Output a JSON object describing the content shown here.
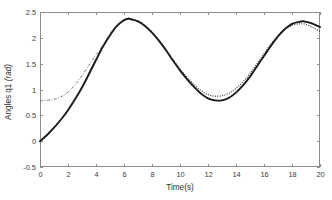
{
  "figure": {
    "background_color": "#ffffff",
    "axis_color": "#8c8c8c",
    "plot_area": {
      "left": 40,
      "top": 12,
      "right": 320,
      "bottom": 167
    }
  },
  "chart_data": {
    "type": "line",
    "title": "",
    "xlabel": "Time(s)",
    "ylabel": "Angles q1 (rad)",
    "ylabel_main": "Angles q1",
    "ylabel_unit": "(rad)",
    "xlim": [
      0,
      20
    ],
    "ylim": [
      -0.5,
      2.5
    ],
    "xticks": [
      0,
      2,
      4,
      6,
      8,
      10,
      12,
      14,
      16,
      18,
      20
    ],
    "xtick_labels": [
      "0",
      "2",
      "4",
      "6",
      "8",
      "10",
      "12",
      "14",
      "16",
      "18",
      "20"
    ],
    "yticks": [
      -0.5,
      0,
      0.5,
      1,
      1.5,
      2,
      2.5
    ],
    "ytick_labels": [
      "-0.5",
      "0",
      "0.5",
      "1",
      "1.5",
      "2",
      "2.5"
    ],
    "grid": false,
    "legend": false,
    "legend_position": "none",
    "annotations": [],
    "x": [
      0,
      0.5,
      1,
      1.5,
      2,
      2.5,
      3,
      3.5,
      4,
      4.5,
      5,
      5.5,
      6,
      6.3,
      6.5,
      7,
      7.5,
      8,
      8.5,
      9,
      9.5,
      10,
      10.5,
      11,
      11.5,
      12,
      12.5,
      13,
      13.5,
      14,
      14.5,
      15,
      15.5,
      16,
      16.5,
      17,
      17.5,
      18,
      18.5,
      18.8,
      19,
      19.5,
      20
    ],
    "series": [
      {
        "name": "reference-trajectory",
        "style": "solid",
        "color": "#1a1a1a",
        "values": [
          0.0,
          0.12,
          0.26,
          0.42,
          0.6,
          0.81,
          1.04,
          1.3,
          1.57,
          1.83,
          2.05,
          2.23,
          2.34,
          2.37,
          2.36,
          2.32,
          2.23,
          2.1,
          1.94,
          1.76,
          1.56,
          1.37,
          1.2,
          1.05,
          0.92,
          0.83,
          0.79,
          0.79,
          0.84,
          0.94,
          1.08,
          1.25,
          1.45,
          1.65,
          1.85,
          2.03,
          2.17,
          2.27,
          2.31,
          2.32,
          2.31,
          2.27,
          2.21
        ]
      },
      {
        "name": "tracked-output-dotted",
        "style": "dotted",
        "color": "#2b2b2b",
        "values": [
          0.0,
          0.12,
          0.26,
          0.42,
          0.6,
          0.81,
          1.05,
          1.32,
          1.59,
          1.85,
          2.07,
          2.25,
          2.35,
          2.38,
          2.37,
          2.33,
          2.24,
          2.11,
          1.95,
          1.77,
          1.58,
          1.4,
          1.24,
          1.1,
          0.98,
          0.9,
          0.87,
          0.88,
          0.93,
          1.02,
          1.15,
          1.31,
          1.5,
          1.69,
          1.88,
          2.04,
          2.17,
          2.24,
          2.27,
          2.27,
          2.26,
          2.2,
          2.12
        ]
      },
      {
        "name": "initial-error-dashdot",
        "style": "dash-dot",
        "color": "#7d7d7d",
        "values": [
          0.78,
          0.79,
          0.81,
          0.86,
          0.95,
          1.09,
          1.27,
          1.47,
          1.67,
          1.86,
          2.05,
          2.23,
          2.34,
          2.37,
          2.36,
          2.32,
          2.23,
          2.1,
          1.94,
          1.76,
          1.56,
          1.37,
          1.2,
          1.05,
          0.92,
          0.83,
          0.79,
          0.79,
          0.84,
          0.94,
          1.08,
          1.25,
          1.45,
          1.65,
          1.85,
          2.03,
          2.17,
          2.27,
          2.31,
          2.32,
          2.31,
          2.27,
          2.21
        ]
      }
    ]
  }
}
